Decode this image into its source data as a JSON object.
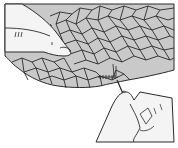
{
  "illustration": {
    "subject": "Hands hand-stitching a crazy-patchwork fabric with a needle",
    "colors": {
      "background": "#ffffff",
      "fabric_fill": "#c9c9c9",
      "line": "#2a2a2a",
      "skin_fill": "#f4f4f4"
    },
    "elements": [
      "left-hand-holding-fabric",
      "patchwork-fabric",
      "running-stitches",
      "needle",
      "right-hand-pulling-needle"
    ]
  }
}
